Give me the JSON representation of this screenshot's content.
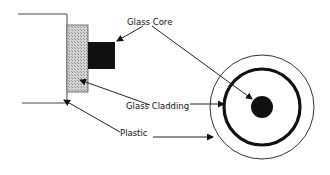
{
  "diagram": {
    "labels": {
      "core": "Glass Core",
      "cladding": "Glass Cladding",
      "plastic": "Plastic"
    },
    "colors": {
      "line": "#222222",
      "core_fill": "#111111",
      "cladding_fill": "#b8b8b8",
      "background": "#ffffff"
    },
    "side_view": {
      "jacket_top_y": 14,
      "jacket_bottom_y": 103,
      "cladding_rect": [
        67,
        25,
        21,
        67
      ],
      "core_rect": [
        88,
        42,
        27,
        27
      ]
    },
    "cross_section": {
      "center": [
        262,
        107
      ],
      "plastic_radius": 52,
      "cladding_radius": 38,
      "core_radius": 11
    }
  }
}
